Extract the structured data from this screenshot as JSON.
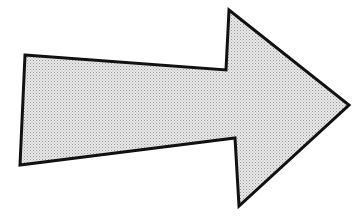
{
  "diagram": {
    "shape": "right-arrow",
    "direction": "right",
    "fill_style": "stippled-halftone",
    "colors": {
      "background": "#ffffff",
      "fill_light": "#e6e6e6",
      "fill_dot": "#9a9a9a",
      "stroke": "#111111"
    },
    "stroke_width": 3,
    "points": "25,55 226,70 229,10 349,105 239,206 235,138 20,165"
  }
}
